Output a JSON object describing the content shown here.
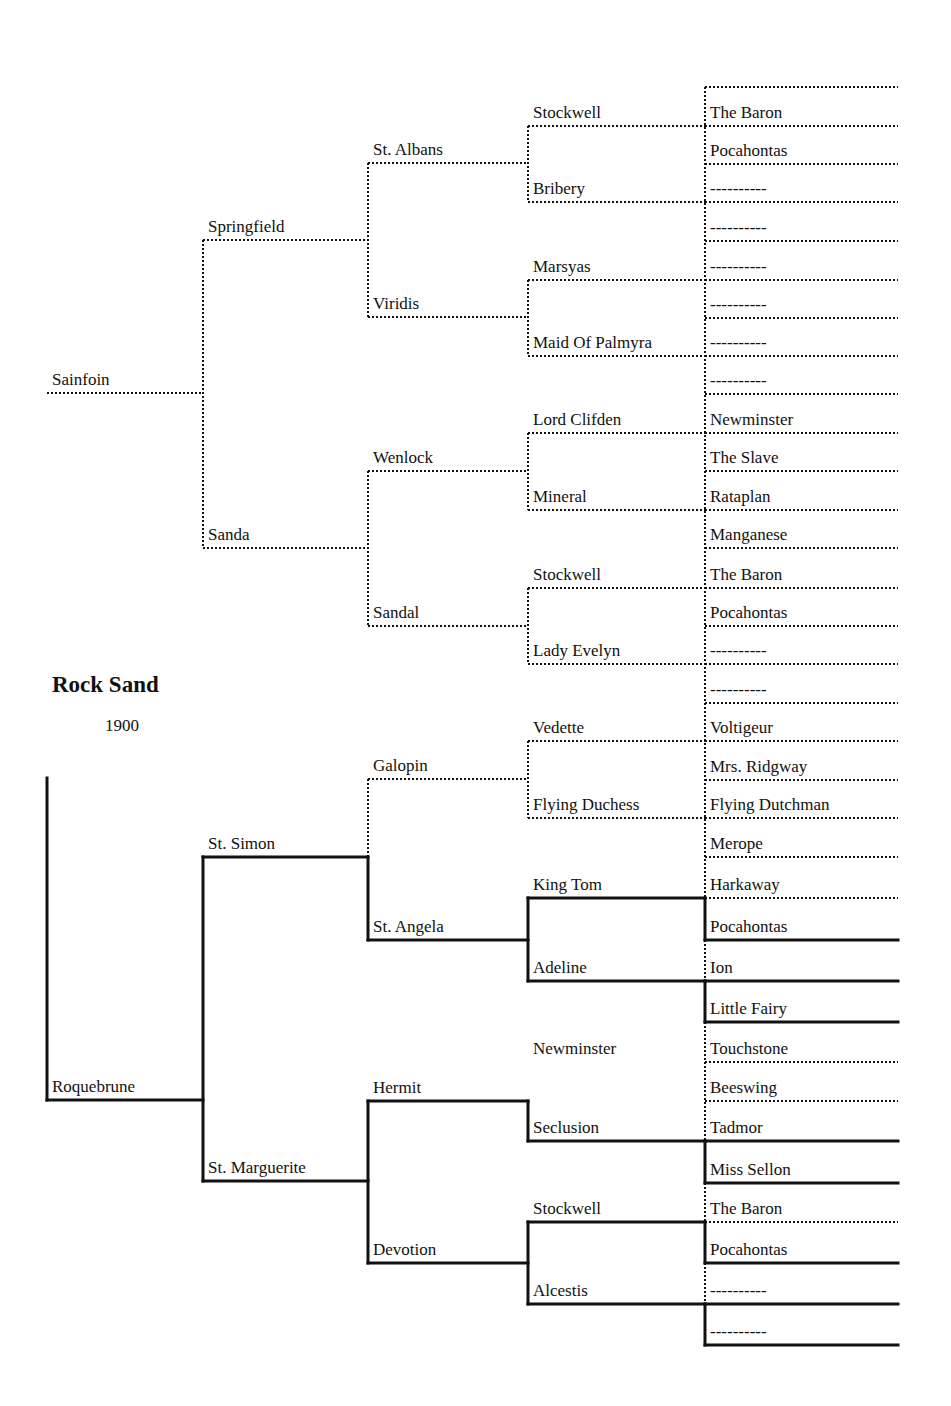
{
  "horse": {
    "name": "Rock Sand",
    "year": "1900"
  },
  "style": {
    "line_color": "#111111",
    "dotted_width": 2,
    "solid_width": 3
  },
  "columns_x": [
    47,
    203,
    368,
    528,
    705
  ],
  "right_edge": 898,
  "pedigree": [
    {
      "gen": 0,
      "name": "Sainfoin",
      "line_y": 393,
      "style": "dotted"
    },
    {
      "gen": 0,
      "name": "Roquebrune",
      "line_y": 1100,
      "style": "solid"
    },
    {
      "gen": 1,
      "name": "Springfield",
      "line_y": 240,
      "style": "dotted"
    },
    {
      "gen": 1,
      "name": "Sanda",
      "line_y": 548,
      "style": "dotted"
    },
    {
      "gen": 1,
      "name": "St. Simon",
      "line_y": 857,
      "style": "solid"
    },
    {
      "gen": 1,
      "name": "St. Marguerite",
      "line_y": 1181,
      "style": "solid"
    },
    {
      "gen": 2,
      "name": "St. Albans",
      "line_y": 163,
      "style": "dotted"
    },
    {
      "gen": 2,
      "name": "Viridis",
      "line_y": 317,
      "style": "dotted"
    },
    {
      "gen": 2,
      "name": "Wenlock",
      "line_y": 471,
      "style": "dotted"
    },
    {
      "gen": 2,
      "name": "Sandal",
      "line_y": 626,
      "style": "dotted"
    },
    {
      "gen": 2,
      "name": "Galopin",
      "line_y": 779,
      "style": "dotted"
    },
    {
      "gen": 2,
      "name": "St. Angela",
      "line_y": 940,
      "style": "solid"
    },
    {
      "gen": 2,
      "name": "Hermit",
      "line_y": 1101,
      "style": "solid"
    },
    {
      "gen": 2,
      "name": "Devotion",
      "line_y": 1263,
      "style": "solid"
    },
    {
      "gen": 3,
      "name": "Stockwell",
      "line_y": 126,
      "style": "dotted"
    },
    {
      "gen": 3,
      "name": "Bribery",
      "line_y": 202,
      "style": "dotted"
    },
    {
      "gen": 3,
      "name": "Marsyas",
      "line_y": 280,
      "style": "dotted"
    },
    {
      "gen": 3,
      "name": "Maid Of Palmyra",
      "line_y": 356,
      "style": "dotted"
    },
    {
      "gen": 3,
      "name": "Lord Clifden",
      "line_y": 433,
      "style": "dotted"
    },
    {
      "gen": 3,
      "name": "Mineral",
      "line_y": 510,
      "style": "dotted"
    },
    {
      "gen": 3,
      "name": "Stockwell",
      "line_y": 588,
      "style": "dotted"
    },
    {
      "gen": 3,
      "name": "Lady Evelyn",
      "line_y": 664,
      "style": "dotted"
    },
    {
      "gen": 3,
      "name": "Vedette",
      "line_y": 741,
      "style": "dotted"
    },
    {
      "gen": 3,
      "name": "Flying Duchess",
      "line_y": 818,
      "style": "dotted"
    },
    {
      "gen": 3,
      "name": "King Tom",
      "line_y": 898,
      "style": "solid"
    },
    {
      "gen": 3,
      "name": "Adeline",
      "line_y": 981,
      "style": "solid"
    },
    {
      "gen": 3,
      "name": "Newminster",
      "line_y": 1062,
      "style": "none"
    },
    {
      "gen": 3,
      "name": "Seclusion",
      "line_y": 1141,
      "style": "solid"
    },
    {
      "gen": 3,
      "name": "Stockwell",
      "line_y": 1222,
      "style": "solid"
    },
    {
      "gen": 3,
      "name": "Alcestis",
      "line_y": 1304,
      "style": "solid"
    },
    {
      "gen": 4,
      "name": "The Baron",
      "line_y": 126,
      "style": "dotted"
    },
    {
      "gen": 4,
      "name": "Pocahontas",
      "line_y": 164,
      "style": "dotted"
    },
    {
      "gen": 4,
      "name": "----------",
      "line_y": 202,
      "style": "dotted"
    },
    {
      "gen": 4,
      "name": "----------",
      "line_y": 241,
      "style": "dotted"
    },
    {
      "gen": 4,
      "name": "----------",
      "line_y": 280,
      "style": "dotted"
    },
    {
      "gen": 4,
      "name": "----------",
      "line_y": 318,
      "style": "dotted"
    },
    {
      "gen": 4,
      "name": "----------",
      "line_y": 356,
      "style": "dotted"
    },
    {
      "gen": 4,
      "name": "----------",
      "line_y": 394,
      "style": "dotted"
    },
    {
      "gen": 4,
      "name": "Newminster",
      "line_y": 433,
      "style": "dotted"
    },
    {
      "gen": 4,
      "name": "The Slave",
      "line_y": 471,
      "style": "dotted"
    },
    {
      "gen": 4,
      "name": "Rataplan",
      "line_y": 510,
      "style": "dotted"
    },
    {
      "gen": 4,
      "name": "Manganese",
      "line_y": 548,
      "style": "dotted"
    },
    {
      "gen": 4,
      "name": "The Baron",
      "line_y": 588,
      "style": "dotted"
    },
    {
      "gen": 4,
      "name": "Pocahontas",
      "line_y": 626,
      "style": "dotted"
    },
    {
      "gen": 4,
      "name": "----------",
      "line_y": 664,
      "style": "dotted"
    },
    {
      "gen": 4,
      "name": "----------",
      "line_y": 703,
      "style": "dotted"
    },
    {
      "gen": 4,
      "name": "Voltigeur",
      "line_y": 741,
      "style": "dotted"
    },
    {
      "gen": 4,
      "name": "Mrs. Ridgway",
      "line_y": 780,
      "style": "dotted"
    },
    {
      "gen": 4,
      "name": "Flying Dutchman",
      "line_y": 818,
      "style": "dotted"
    },
    {
      "gen": 4,
      "name": "Merope",
      "line_y": 857,
      "style": "dotted"
    },
    {
      "gen": 4,
      "name": "Harkaway",
      "line_y": 898,
      "style": "dotted"
    },
    {
      "gen": 4,
      "name": "Pocahontas",
      "line_y": 940,
      "style": "solid"
    },
    {
      "gen": 4,
      "name": "Ion",
      "line_y": 981,
      "style": "solid"
    },
    {
      "gen": 4,
      "name": "Little Fairy",
      "line_y": 1022,
      "style": "solid"
    },
    {
      "gen": 4,
      "name": "Touchstone",
      "line_y": 1062,
      "style": "dotted"
    },
    {
      "gen": 4,
      "name": "Beeswing",
      "line_y": 1101,
      "style": "dotted"
    },
    {
      "gen": 4,
      "name": "Tadmor",
      "line_y": 1141,
      "style": "solid"
    },
    {
      "gen": 4,
      "name": "Miss Sellon",
      "line_y": 1183,
      "style": "solid"
    },
    {
      "gen": 4,
      "name": "The Baron",
      "line_y": 1222,
      "style": "dotted"
    },
    {
      "gen": 4,
      "name": "Pocahontas",
      "line_y": 1263,
      "style": "solid"
    },
    {
      "gen": 4,
      "name": "----------",
      "line_y": 1304,
      "style": "solid"
    },
    {
      "gen": 4,
      "name": "----------",
      "line_y": 1345,
      "style": "solid"
    }
  ],
  "extra_lines": [
    {
      "x1": 705,
      "y1": 87,
      "x2": 898,
      "y2": 87,
      "style": "dotted",
      "name": "gen5-top-line"
    }
  ],
  "brackets": [
    {
      "x": 203,
      "y1": 240,
      "y2": 548,
      "style": "dotted"
    },
    {
      "x": 368,
      "y1": 163,
      "y2": 317,
      "style": "dotted"
    },
    {
      "x": 368,
      "y1": 471,
      "y2": 626,
      "style": "dotted"
    },
    {
      "x": 528,
      "y1": 126,
      "y2": 202,
      "style": "dotted"
    },
    {
      "x": 528,
      "y1": 280,
      "y2": 356,
      "style": "dotted"
    },
    {
      "x": 528,
      "y1": 433,
      "y2": 510,
      "style": "dotted"
    },
    {
      "x": 528,
      "y1": 588,
      "y2": 664,
      "style": "dotted"
    },
    {
      "x": 705,
      "y1": 87,
      "y2": 703,
      "style": "dotted"
    },
    {
      "x": 47,
      "y1": 778,
      "y2": 1100,
      "style": "solid"
    },
    {
      "x": 203,
      "y1": 857,
      "y2": 1181,
      "style": "solid"
    },
    {
      "x": 368,
      "y1": 779,
      "y2": 857,
      "style": "dotted"
    },
    {
      "x": 368,
      "y1": 857,
      "y2": 940,
      "style": "solid"
    },
    {
      "x": 368,
      "y1": 1101,
      "y2": 1263,
      "style": "solid"
    },
    {
      "x": 528,
      "y1": 741,
      "y2": 818,
      "style": "dotted"
    },
    {
      "x": 528,
      "y1": 898,
      "y2": 981,
      "style": "solid"
    },
    {
      "x": 528,
      "y1": 1101,
      "y2": 1141,
      "style": "solid"
    },
    {
      "x": 528,
      "y1": 1222,
      "y2": 1304,
      "style": "solid"
    },
    {
      "x": 705,
      "y1": 703,
      "y2": 898,
      "style": "dotted"
    },
    {
      "x": 705,
      "y1": 898,
      "y2": 940,
      "style": "solid"
    },
    {
      "x": 705,
      "y1": 940,
      "y2": 981,
      "style": "dotted"
    },
    {
      "x": 705,
      "y1": 981,
      "y2": 1022,
      "style": "solid"
    },
    {
      "x": 705,
      "y1": 1022,
      "y2": 1141,
      "style": "dotted"
    },
    {
      "x": 705,
      "y1": 1141,
      "y2": 1183,
      "style": "solid"
    },
    {
      "x": 705,
      "y1": 1183,
      "y2": 1222,
      "style": "dotted"
    },
    {
      "x": 705,
      "y1": 1222,
      "y2": 1263,
      "style": "solid"
    },
    {
      "x": 705,
      "y1": 1263,
      "y2": 1304,
      "style": "dotted"
    },
    {
      "x": 705,
      "y1": 1304,
      "y2": 1345,
      "style": "solid"
    }
  ],
  "parent_links": [
    {
      "from_x": 203,
      "y": 393,
      "style": "dotted"
    },
    {
      "from_x": 368,
      "y": 240,
      "style": "dotted"
    },
    {
      "from_x": 368,
      "y": 548,
      "style": "dotted"
    },
    {
      "from_x": 528,
      "y": 163,
      "style": "dotted"
    },
    {
      "from_x": 528,
      "y": 317,
      "style": "dotted"
    },
    {
      "from_x": 528,
      "y": 471,
      "style": "dotted"
    },
    {
      "from_x": 528,
      "y": 626,
      "style": "dotted"
    },
    {
      "from_x": 705,
      "y": 126,
      "style": "dotted"
    },
    {
      "from_x": 705,
      "y": 202,
      "style": "dotted"
    },
    {
      "from_x": 705,
      "y": 280,
      "style": "dotted"
    },
    {
      "from_x": 705,
      "y": 356,
      "style": "dotted"
    },
    {
      "from_x": 705,
      "y": 433,
      "style": "dotted"
    },
    {
      "from_x": 705,
      "y": 510,
      "style": "dotted"
    },
    {
      "from_x": 705,
      "y": 588,
      "style": "dotted"
    },
    {
      "from_x": 705,
      "y": 664,
      "style": "dotted"
    },
    {
      "from_x": 705,
      "y": 741,
      "style": "dotted"
    },
    {
      "from_x": 705,
      "y": 818,
      "style": "dotted"
    }
  ]
}
